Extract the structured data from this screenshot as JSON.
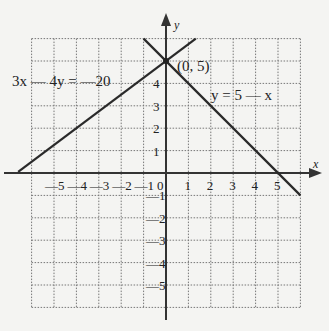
{
  "chart_data": {
    "type": "line",
    "title": "",
    "xlabel": "x",
    "ylabel": "y",
    "xlim": [
      -6,
      6
    ],
    "ylim": [
      -6,
      6
    ],
    "grid": true,
    "x_ticks": [
      "—5",
      "—4",
      "—3",
      "—2",
      "—1",
      "0",
      "1",
      "2",
      "3",
      "4",
      "5"
    ],
    "y_ticks": [
      "5",
      "4",
      "3",
      "2",
      "1",
      "—1",
      "—2",
      "—3",
      "—4",
      "—5"
    ],
    "series": [
      {
        "name": "3x — 4y = —20",
        "equation": "3x - 4y = -20",
        "x": [
          -6.6,
          1.33
        ],
        "y": [
          0.05,
          6
        ]
      },
      {
        "name": "y = 5 — x",
        "equation": "y = 5 - x",
        "x": [
          -1,
          6
        ],
        "y": [
          6,
          -1
        ]
      }
    ],
    "annotations": [
      {
        "text": "(0, 5)",
        "x": 0,
        "y": 5,
        "type": "intersection-point"
      }
    ]
  },
  "labels": {
    "x_axis": "x",
    "y_axis": "y",
    "line1": "3x — 4y = —20",
    "line2": "y = 5 — x",
    "point": "(0, 5)"
  }
}
